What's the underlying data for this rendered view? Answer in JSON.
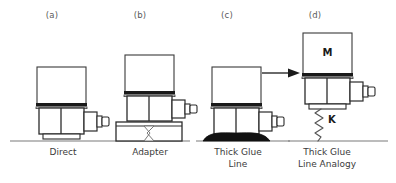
{
  "figure": {
    "type": "technical-line-diagram",
    "background_color": "#ffffff",
    "line_color": "#333333",
    "text_color": "#3b3b3b",
    "ground_line_color": "#7a7a7a",
    "glue_color": "#111111"
  },
  "panels": [
    {
      "id": "a",
      "panel_label": "(a)",
      "caption": "Direct",
      "caption_lines": [
        "Direct"
      ],
      "has_adapter": false,
      "has_glue_line": false,
      "has_spring": false,
      "mass_label": ""
    },
    {
      "id": "b",
      "panel_label": "(b)",
      "caption": "Adapter",
      "caption_lines": [
        "Adapter"
      ],
      "has_adapter": true,
      "has_glue_line": false,
      "has_spring": false,
      "mass_label": ""
    },
    {
      "id": "c",
      "panel_label": "(c)",
      "caption": "Thick Glue Line",
      "caption_lines": [
        "Thick Glue",
        "Line"
      ],
      "has_adapter": false,
      "has_glue_line": true,
      "has_spring": false,
      "mass_label": ""
    },
    {
      "id": "d",
      "panel_label": "(d)",
      "caption": "Thick Glue Line Analogy",
      "caption_lines": [
        "Thick Glue",
        "Line Analogy"
      ],
      "has_adapter": false,
      "has_glue_line": false,
      "has_spring": true,
      "mass_label": "M",
      "spring_label": "K"
    }
  ],
  "annotations": {
    "mass_label": "M",
    "spring_label": "K",
    "arrow": "right-arrow-c-to-d"
  }
}
